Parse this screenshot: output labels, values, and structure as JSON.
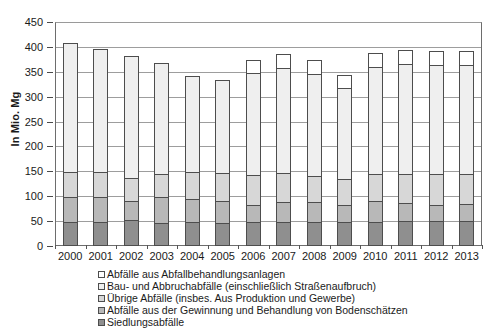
{
  "chart_data": {
    "type": "bar",
    "stacked": true,
    "title": "",
    "subtitle": "",
    "xlabel": "",
    "ylabel": "In Mio. Mg",
    "ylim": [
      0,
      450
    ],
    "ytick_step": 50,
    "yticks": [
      0,
      50,
      100,
      150,
      200,
      250,
      300,
      350,
      400,
      450
    ],
    "grid": true,
    "legend_position": "bottom",
    "categories": [
      "2000",
      "2001",
      "2002",
      "2003",
      "2004",
      "2005",
      "2006",
      "2007",
      "2008",
      "2009",
      "2010",
      "2011",
      "2012",
      "2013"
    ],
    "series": [
      {
        "name": "Siedlungsabfälle",
        "color": "#8f8f8f",
        "values": [
          49,
          49,
          52,
          47,
          48,
          46,
          48,
          48,
          48,
          48,
          49,
          50,
          50,
          50
        ]
      },
      {
        "name": "Abfälle aus der Gewinnung und Behandlung von Bodenschätzen",
        "color": "#b8b8b8",
        "values": [
          49,
          49,
          39,
          51,
          46,
          45,
          35,
          41,
          41,
          34,
          42,
          36,
          33,
          35
        ]
      },
      {
        "name": "Übrige Abfälle (insbes. Aus Produktion und Gewerbe)",
        "color": "#d7d7d7",
        "values": [
          50,
          50,
          46,
          46,
          55,
          55,
          59,
          57,
          52,
          53,
          53,
          59,
          62,
          59
        ]
      },
      {
        "name": "Bau- und Abbruchabfälle (einschließlich Straßenaufbruch)",
        "color": "#efefef",
        "values": [
          259,
          248,
          245,
          223,
          193,
          188,
          206,
          212,
          205,
          183,
          216,
          221,
          219,
          220
        ]
      },
      {
        "name": "Abfälle aus Abfallbehandlungsanlagen",
        "color": "#ffffff",
        "values": [
          0,
          0,
          0,
          0,
          0,
          0,
          26,
          28,
          27,
          25,
          27,
          27,
          27,
          28
        ]
      }
    ],
    "totals": [
      407,
      396,
      382,
      367,
      342,
      334,
      374,
      386,
      373,
      343,
      387,
      393,
      391,
      392
    ]
  },
  "axis": {
    "y_title": "In Mio. Mg",
    "y_tick_labels": [
      "450",
      "400",
      "350",
      "300",
      "250",
      "200",
      "150",
      "100",
      "50",
      "0"
    ],
    "x_tick_labels": [
      "2000",
      "2001",
      "2002",
      "2003",
      "2004",
      "2005",
      "2006",
      "2007",
      "2008",
      "2009",
      "2010",
      "2011",
      "2012",
      "2013"
    ]
  },
  "legend": {
    "items": [
      {
        "label": "Abfälle aus Abfallbehandlungsanlagen",
        "color": "#ffffff"
      },
      {
        "label": "Bau- und Abbruchabfälle (einschließlich Straßenaufbruch)",
        "color": "#efefef"
      },
      {
        "label": "Übrige Abfälle (insbes. Aus Produktion und Gewerbe)",
        "color": "#d7d7d7"
      },
      {
        "label": "Abfälle aus der Gewinnung und Behandlung von Bodenschätzen",
        "color": "#b8b8b8"
      },
      {
        "label": "Siedlungsabfälle",
        "color": "#8f8f8f"
      }
    ]
  },
  "colors": {
    "grid": "#9d9d9d",
    "frame": "#6d6d6d",
    "bar_border": "#4d4d4d",
    "text": "#1a1a1a"
  }
}
